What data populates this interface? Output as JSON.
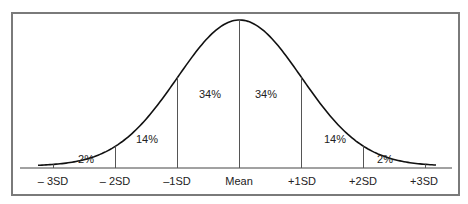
{
  "diagram": {
    "axis_labels": [
      "– 3SD",
      "– 2SD",
      "–1SD",
      "Mean",
      "+1SD",
      "+2SD",
      "+3SD"
    ],
    "segment_percentages": [
      "2%",
      "14%",
      "34%",
      "34%",
      "14%",
      "2%"
    ],
    "colors": {
      "frame": "#7a7a7a",
      "curve": "#111111",
      "lines": "#555555",
      "text": "#222222"
    }
  },
  "chart_data": {
    "type": "area",
    "title": "",
    "xlabel": "",
    "ylabel": "",
    "categories": [
      "-3SD",
      "-2SD",
      "-1SD",
      "Mean",
      "+1SD",
      "+2SD",
      "+3SD"
    ],
    "segments": [
      {
        "from": "-3SD",
        "to": "-2SD",
        "percent": 2
      },
      {
        "from": "-2SD",
        "to": "-1SD",
        "percent": 14
      },
      {
        "from": "-1SD",
        "to": "Mean",
        "percent": 34
      },
      {
        "from": "Mean",
        "to": "+1SD",
        "percent": 34
      },
      {
        "from": "+1SD",
        "to": "+2SD",
        "percent": 14
      },
      {
        "from": "+2SD",
        "to": "+3SD",
        "percent": 2
      }
    ],
    "grid": false,
    "legend": null
  }
}
